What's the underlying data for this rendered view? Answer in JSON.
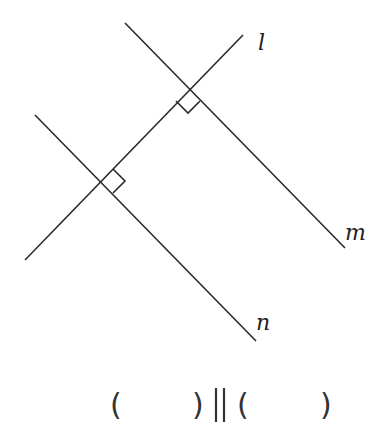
{
  "diagram": {
    "lines": [
      {
        "name": "l",
        "label": "l",
        "x1": 25,
        "y1": 260,
        "x2": 243,
        "y2": 35
      },
      {
        "name": "m",
        "label": "m",
        "x1": 125,
        "y1": 23,
        "x2": 345,
        "y2": 248
      },
      {
        "name": "n",
        "label": "n",
        "x1": 35,
        "y1": 115,
        "x2": 256,
        "y2": 341
      }
    ],
    "right_angles": [
      {
        "at": "l∩m",
        "x": 188,
        "y": 89
      },
      {
        "at": "l∩n",
        "x": 101,
        "y": 181
      }
    ],
    "labels": {
      "l": "l",
      "m": "m",
      "n": "n"
    }
  },
  "question": {
    "left_open": "(",
    "left_close": ")",
    "parallel_symbol": "||",
    "right_open": "(",
    "right_close": ")",
    "blank_left": "",
    "blank_right": ""
  }
}
